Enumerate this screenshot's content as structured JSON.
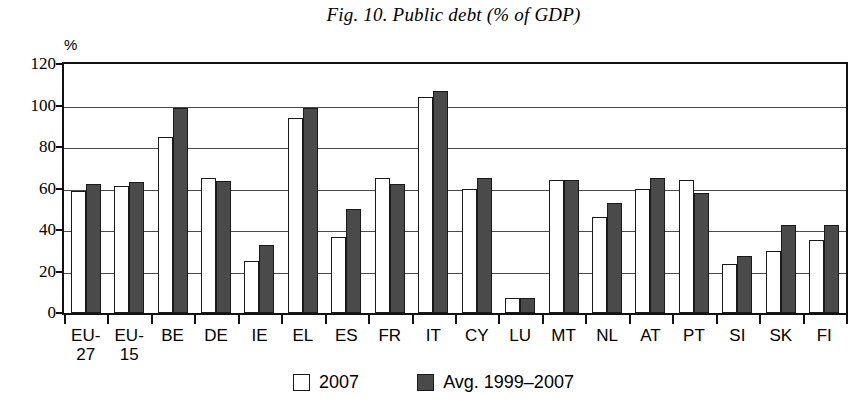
{
  "chart_data": {
    "type": "bar",
    "title": "Fig. 10. Public debt (% of GDP)",
    "xlabel": "",
    "ylabel": "%",
    "ylim": [
      0,
      120
    ],
    "yticks": [
      0,
      20,
      40,
      60,
      80,
      100,
      120
    ],
    "grid": true,
    "legend_position": "bottom",
    "categories": [
      "EU-27",
      "EU-15",
      "BE",
      "DE",
      "IE",
      "EL",
      "ES",
      "FR",
      "IT",
      "CY",
      "LU",
      "MT",
      "NL",
      "AT",
      "PT",
      "SI",
      "SK",
      "FI"
    ],
    "category_lines": [
      [
        "EU-",
        "27"
      ],
      [
        "EU-",
        "15"
      ],
      [
        "BE"
      ],
      [
        "DE"
      ],
      [
        "IE"
      ],
      [
        "EL"
      ],
      [
        "ES"
      ],
      [
        "FR"
      ],
      [
        "IT"
      ],
      [
        "CY"
      ],
      [
        "LU"
      ],
      [
        "MT"
      ],
      [
        "NL"
      ],
      [
        "AT"
      ],
      [
        "PT"
      ],
      [
        "SI"
      ],
      [
        "SK"
      ],
      [
        "FI"
      ]
    ],
    "series": [
      {
        "name": "2007",
        "color": "#ffffff",
        "values": [
          59,
          61,
          85,
          65,
          25,
          94,
          36.5,
          65,
          104,
          60,
          7,
          64,
          46.5,
          60,
          64,
          23.5,
          30,
          35
        ]
      },
      {
        "name": "Avg. 1999–2007",
        "color": "#4a4a4a",
        "values": [
          62,
          63,
          99,
          63.5,
          33,
          99,
          50,
          62,
          107,
          65,
          7,
          64,
          53,
          65,
          58,
          27.5,
          42.5,
          42.5
        ]
      }
    ]
  },
  "figure": {
    "title": "Fig. 10. Public debt (% of GDP)",
    "y_unit": "%"
  },
  "legend": {
    "items": [
      {
        "label": "2007",
        "swatch": "light"
      },
      {
        "label": "Avg. 1999–2007",
        "swatch": "dark"
      }
    ]
  }
}
